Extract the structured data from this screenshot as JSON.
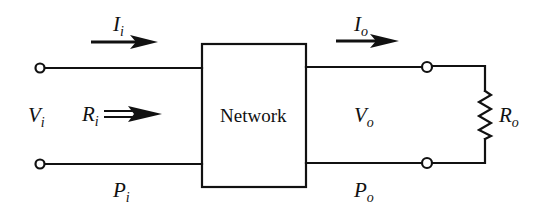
{
  "diagram": {
    "block": {
      "label": "Network"
    },
    "labels": {
      "input_current": {
        "symbol": "I",
        "subscript": "i"
      },
      "output_current": {
        "symbol": "I",
        "subscript": "o"
      },
      "input_voltage": {
        "symbol": "V",
        "subscript": "i"
      },
      "input_resistance": {
        "symbol": "R",
        "subscript": "i"
      },
      "output_voltage": {
        "symbol": "V",
        "subscript": "o"
      },
      "load_resistance": {
        "symbol": "R",
        "subscript": "o"
      },
      "input_power": {
        "symbol": "P",
        "subscript": "i"
      },
      "output_power": {
        "symbol": "P",
        "subscript": "o"
      }
    },
    "colors": {
      "line": "#111111",
      "background": "#ffffff"
    }
  }
}
